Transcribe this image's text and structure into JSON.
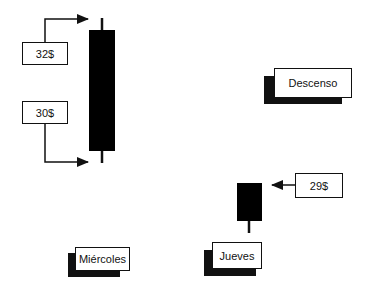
{
  "diagram": {
    "price_labels": {
      "high": "32$",
      "low": "30$",
      "thursday_price": "29$"
    },
    "trend_label": "Descenso",
    "day_labels": {
      "wednesday": "Miércoles",
      "thursday": "Jueves"
    },
    "candles": [
      {
        "day": "Miércoles",
        "type": "bearish",
        "color": "#000000"
      },
      {
        "day": "Jueves",
        "type": "bearish",
        "color": "#000000"
      }
    ]
  }
}
